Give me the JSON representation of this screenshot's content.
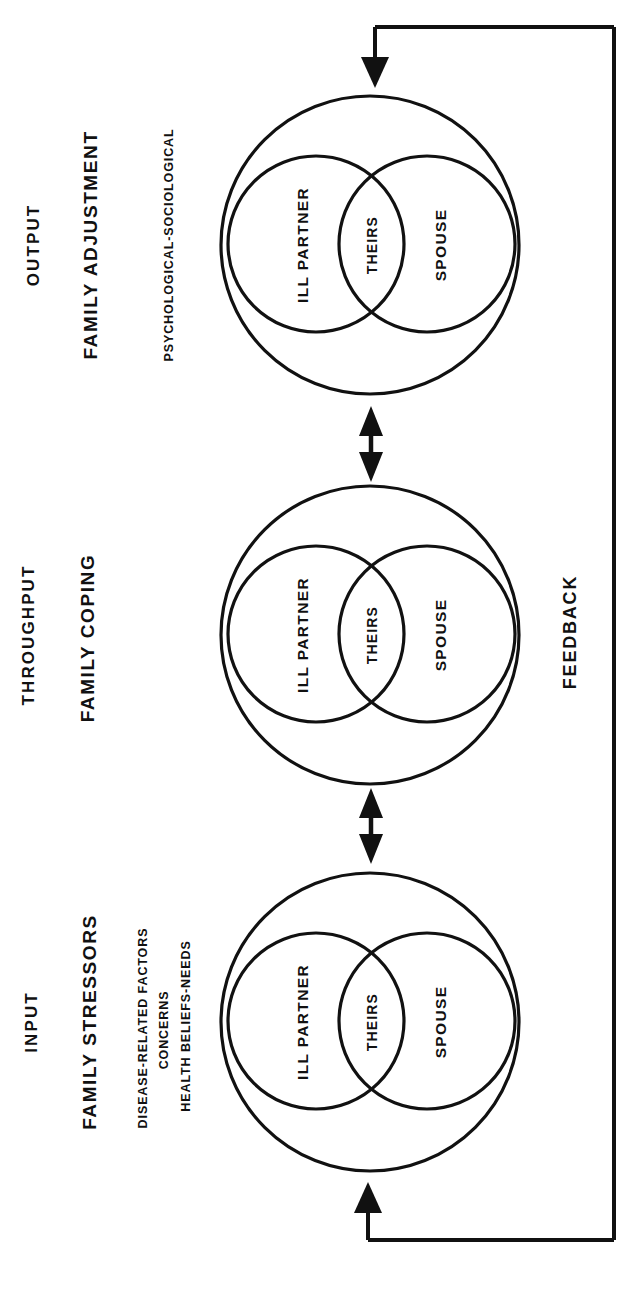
{
  "diagram": {
    "orientation": "rotated-90",
    "line_color": "#111111",
    "background": "#ffffff"
  },
  "columns": [
    {
      "id": "output",
      "stage": "OUTPUT",
      "phase": "FAMILY ADJUSTMENT",
      "details": [
        "PSYCHOLOGICAL-SOCIOLOGICAL"
      ]
    },
    {
      "id": "throughput",
      "stage": "THROUGHPUT",
      "phase": "FAMILY COPING",
      "details": []
    },
    {
      "id": "input",
      "stage": "INPUT",
      "phase": "FAMILY STRESSORS",
      "details": [
        "DISEASE-RELATED FACTORS",
        "CONCERNS",
        "HEALTH BELIEFS-NEEDS"
      ]
    }
  ],
  "venn": {
    "left_label": "ILL PARTNER",
    "center_label": "THEIRS",
    "right_label": "SPOUSE"
  },
  "feedback": {
    "label": "FEEDBACK"
  },
  "arrows": {
    "bidirectional_count": 2,
    "feedback_direction": "input-to-output"
  }
}
